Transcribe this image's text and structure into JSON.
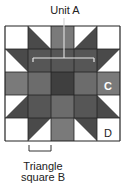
{
  "diagram": {
    "labels": {
      "unit_a": "Unit A",
      "triangle_square_b_line1": "Triangle",
      "triangle_square_b_line2": "square B",
      "cell_c": "C",
      "cell_d": "D"
    },
    "grid": {
      "rows": 5,
      "cols": 5,
      "origin_x": 5,
      "origin_y": 26,
      "cell_size": 23
    },
    "colors": {
      "white": "#ffffff",
      "c_gray": "#7a7a7a",
      "triangle_dark": "#4a4a4a",
      "dark_cell": "#565656",
      "center_cell": "#3f3f3f",
      "medium_cell": "#6c6c6c",
      "grid_line": "#222222",
      "bracket": "#e8e8e8"
    },
    "cells": [
      [
        "D",
        "tri-bl",
        "C",
        "tri-br",
        "D"
      ],
      [
        "tri-tr",
        "dark",
        "dark",
        "dark",
        "tri-tl"
      ],
      [
        "C",
        "medium",
        "center",
        "medium",
        "C"
      ],
      [
        "tri-br",
        "dark",
        "medium",
        "dark",
        "tri-bl"
      ],
      [
        "D",
        "tri-tl",
        "C",
        "tri-tr",
        "D"
      ]
    ],
    "annotated_cells": {
      "c_label_cell": [
        2,
        4
      ],
      "d_label_cell": [
        4,
        4
      ]
    }
  }
}
